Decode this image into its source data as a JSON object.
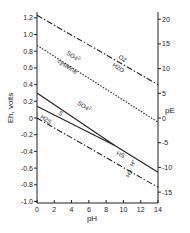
{
  "chart_data": {
    "type": "line",
    "title": "",
    "xlabel": "pH",
    "ylabel": "Eh, volts",
    "y2label": "pE",
    "xlim": [
      0,
      14
    ],
    "ylim": [
      -1.0,
      1.3
    ],
    "y2lim": [
      -17,
      22
    ],
    "grid": false,
    "x_ticks": [
      "0",
      "2",
      "4",
      "6",
      "8",
      "10",
      "12",
      "14"
    ],
    "y_ticks": [
      "1.2",
      "1.0",
      "0.8",
      "0.6",
      "0.4",
      "0.2",
      "0",
      "-0.2",
      "-0.4",
      "-0.6",
      "-0.8",
      "-1.0"
    ],
    "y2_ticks": [
      "20",
      "15",
      "10",
      "5",
      "0",
      "-5",
      "-10",
      "-15"
    ],
    "series": [
      {
        "name": "O2 / H2O",
        "style": "dash-dot",
        "x": [
          0,
          14
        ],
        "values": [
          1.23,
          0.4
        ]
      },
      {
        "name": "SO4 2- / cysteine",
        "style": "dotted",
        "x": [
          0,
          14
        ],
        "values": [
          0.87,
          -0.05
        ]
      },
      {
        "name": "S / SO4 2-  (SO4 2- / HS-)",
        "style": "solid",
        "x": [
          0,
          9,
          14
        ],
        "values": [
          0.3,
          -0.33,
          -0.65
        ]
      },
      {
        "name": "H2S / S",
        "style": "solid",
        "x": [
          0,
          9
        ],
        "values": [
          0.14,
          -0.33
        ]
      },
      {
        "name": "H+ / H2",
        "style": "dash-dot",
        "x": [
          0,
          14
        ],
        "values": [
          0.0,
          -0.83
        ]
      }
    ],
    "annotations": [
      {
        "text": "O2",
        "near": "upper dash-dot line"
      },
      {
        "text": "H2O",
        "near": "upper dash-dot line"
      },
      {
        "text": "SO4 2-",
        "near": "dotted line"
      },
      {
        "text": "cysteine",
        "near": "dotted line"
      },
      {
        "text": "SO4 2-",
        "near": "upper solid line"
      },
      {
        "text": "S",
        "near": "solid lines"
      },
      {
        "text": "H2S",
        "near": "lower solid line start"
      },
      {
        "text": "HS-",
        "near": "merged solid line"
      },
      {
        "text": "H+",
        "near": "lower dash-dot line"
      },
      {
        "text": "H2",
        "near": "lower dash-dot line"
      }
    ]
  },
  "labels": {
    "xlabel": "pH",
    "ylabel": "Eh, volts",
    "y2label": "pE",
    "o2": "O2",
    "h2o": "H2O",
    "so4_dotted": "SO4",
    "so4_dotted_charge": "2-",
    "cysteine": "cysteine",
    "so4_solid": "SO4",
    "so4_solid_charge": "2-",
    "s": "S",
    "h2s": "H2S",
    "hs": "HS",
    "hs_charge": "-",
    "hplus": "H",
    "hplus_charge": "+",
    "h2": "H2"
  }
}
